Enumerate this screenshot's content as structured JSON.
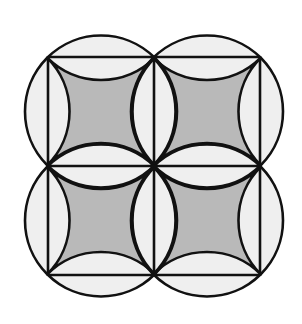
{
  "figure": {
    "title": "",
    "colors": {
      "background": "#ffffff",
      "outer_fill": "#efefef",
      "shaded_fill": "#b9b9b9",
      "stroke": "#111111"
    },
    "stroke_width": 2.6,
    "grid": {
      "x_lines": [
        48,
        154,
        260
      ],
      "y_lines": [
        57,
        166,
        275
      ]
    },
    "circle_radius": 76,
    "cells": [
      {
        "id": "top-left",
        "cx": 101,
        "cy": 111.5
      },
      {
        "id": "top-right",
        "cx": 207,
        "cy": 111.5
      },
      {
        "id": "bottom-left",
        "cx": 101,
        "cy": 220.5
      },
      {
        "id": "bottom-right",
        "cx": 207,
        "cy": 220.5
      }
    ]
  }
}
